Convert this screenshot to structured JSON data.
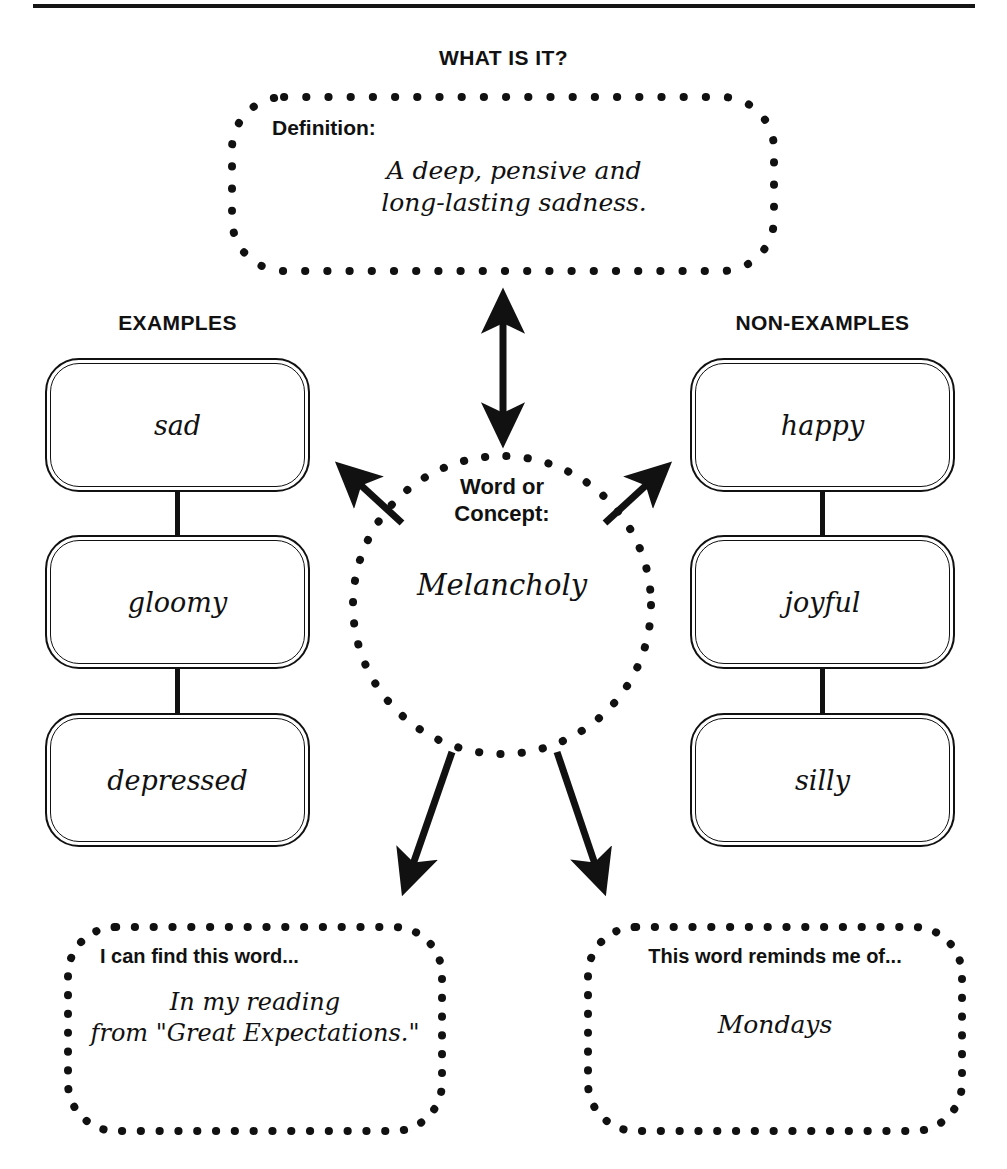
{
  "page": {
    "title": "WHAT IS IT?",
    "divider": "horizontal-rule"
  },
  "definition": {
    "label": "Definition:",
    "value": "A deep, pensive and\nlong-lasting sadness."
  },
  "concept": {
    "label": "Word or\nConcept:",
    "value": "Melancholy"
  },
  "examples": {
    "heading": "EXAMPLES",
    "items": [
      {
        "word": "sad"
      },
      {
        "word": "gloomy"
      },
      {
        "word": "depressed"
      }
    ]
  },
  "non_examples": {
    "heading": "NON-EXAMPLES",
    "items": [
      {
        "word": "happy"
      },
      {
        "word": "joyful"
      },
      {
        "word": "silly"
      }
    ]
  },
  "find_box": {
    "label": "I can find this word...",
    "value": "In my reading\nfrom \"Great Expectations.\""
  },
  "reminds_box": {
    "label": "This word reminds me of...",
    "value": "Mondays"
  },
  "arrows": [
    {
      "name": "definition-arrow",
      "type": "double-headed-vertical"
    },
    {
      "name": "examples-arrow",
      "type": "single-headed-up-left"
    },
    {
      "name": "non-examples-arrow",
      "type": "single-headed-up-right"
    },
    {
      "name": "find-arrow",
      "type": "single-headed-down-left"
    },
    {
      "name": "reminds-arrow",
      "type": "single-headed-down-right"
    }
  ],
  "colors": {
    "ink": "#111111",
    "paper": "#ffffff"
  }
}
